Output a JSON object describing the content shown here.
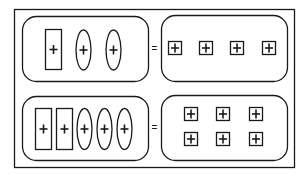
{
  "diagram": {
    "colors": {
      "stroke": "#1a1a1a",
      "background": "#ffffff"
    },
    "equations": [
      {
        "left": {
          "rect_tiles": 1,
          "oval_tiles": 2,
          "tile_symbol": "+"
        },
        "equals": "=",
        "right": {
          "unit_tiles": 4,
          "tile_symbol": "+"
        }
      },
      {
        "left": {
          "rect_tiles": 2,
          "oval_tiles": 3,
          "tile_symbol": "+"
        },
        "equals": "=",
        "right": {
          "unit_tiles": 6,
          "tile_symbol": "+"
        }
      }
    ]
  }
}
